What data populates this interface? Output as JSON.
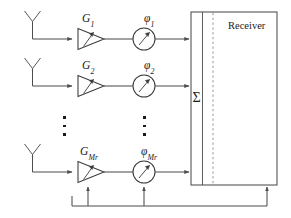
{
  "diagram": {
    "colors": {
      "line": "#4d4d4d",
      "shape_stroke": "#3a3a3a",
      "text": "#1a1a1a",
      "background": "#ffffff",
      "dashed_divider": "#8c8c8c"
    },
    "receiver": {
      "label": "Receiver",
      "summation_symbol": "Σ"
    },
    "branches": [
      {
        "index": 1,
        "antenna_name": "antenna-1",
        "gain": {
          "symbol": "G",
          "subscript": "1"
        },
        "phase": {
          "symbol": "φ",
          "subscript": "1"
        }
      },
      {
        "index": 2,
        "antenna_name": "antenna-2",
        "gain": {
          "symbol": "G",
          "subscript": "2"
        },
        "phase": {
          "symbol": "φ",
          "subscript": "2"
        }
      },
      {
        "index": 3,
        "antenna_name": "antenna-mr",
        "gain": {
          "symbol": "G",
          "subscript": "Mr"
        },
        "phase": {
          "symbol": "φ",
          "subscript": "Mr"
        }
      }
    ],
    "ellipsis": {
      "dot_character": "▪",
      "columns": [
        {
          "name": "ellipsis-gain-column",
          "count": 3
        },
        {
          "name": "ellipsis-phase-column",
          "count": 3
        }
      ]
    },
    "feedback": {
      "name": "feedback-control-bus",
      "targets": [
        "gain-amplifier-mr",
        "phase-shifter-mr",
        "receiver-block"
      ]
    }
  }
}
